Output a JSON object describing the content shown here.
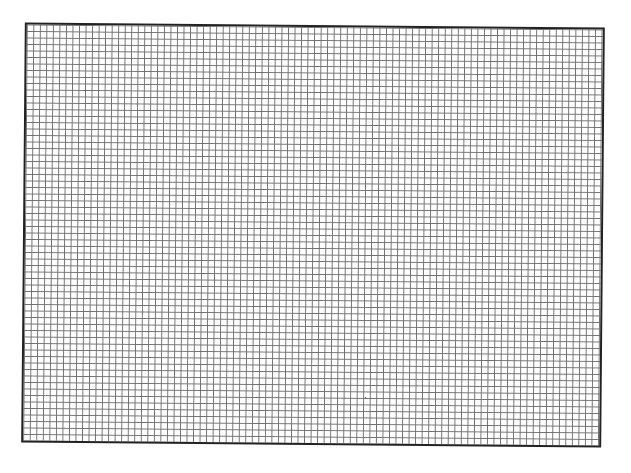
{
  "grid_paper": {
    "columns": 88,
    "rows": 64,
    "line_color": "#555555",
    "border_color": "#222222",
    "background_color": "#ffffff",
    "rotation_deg": 0.5
  }
}
